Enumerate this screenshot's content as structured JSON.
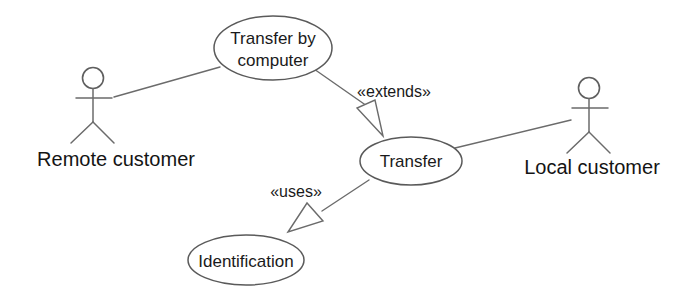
{
  "diagram": {
    "kind": "uml-use-case-diagram",
    "background_color": "#ffffff",
    "line_color": "#6b6b6b",
    "text_color": "#1a1a1a",
    "actors": [
      {
        "id": "remote-customer",
        "label": "Remote customer",
        "label_x": 116,
        "label_y": 166,
        "head_cx": 93,
        "head_cy": 78,
        "head_r": 10.5,
        "body_top_y": 88.5,
        "body_bottom_y": 122,
        "arm_y": 98,
        "arm_left_x": 76,
        "arm_right_x": 112,
        "leg_left_x": 71,
        "leg_right_x": 114,
        "leg_bottom_y": 143
      },
      {
        "id": "local-customer",
        "label": "Local customer",
        "label_x": 592,
        "label_y": 174,
        "head_cx": 589,
        "head_cy": 88,
        "head_r": 10.5,
        "body_top_y": 98.5,
        "body_bottom_y": 132,
        "arm_y": 108,
        "arm_left_x": 572,
        "arm_right_x": 608,
        "leg_left_x": 567,
        "leg_right_x": 610,
        "leg_bottom_y": 153
      }
    ],
    "use_cases": [
      {
        "id": "transfer-by-computer",
        "lines": [
          "Transfer by",
          "computer"
        ],
        "line1": "Transfer by",
        "line2": "computer",
        "cx": 273,
        "cy": 48,
        "rx": 59,
        "ry": 32,
        "text_x": 273,
        "text_y1": 44,
        "text_y2": 66
      },
      {
        "id": "transfer",
        "line1": "Transfer",
        "cx": 411,
        "cy": 161,
        "rx": 51,
        "ry": 24,
        "text_x": 411,
        "text_y1": 167
      },
      {
        "id": "identification",
        "line1": "Identification",
        "cx": 246,
        "cy": 260,
        "rx": 58,
        "ry": 25,
        "text_x": 246,
        "text_y1": 267
      }
    ],
    "associations": [
      {
        "id": "remote-customer-to-transfer-by-computer",
        "from": "remote-customer",
        "to": "transfer-by-computer",
        "x1": 114,
        "y1": 97,
        "x2": 220,
        "y2": 67
      },
      {
        "id": "local-customer-to-transfer",
        "from": "local-customer",
        "to": "transfer",
        "x1": 571,
        "y1": 120,
        "x2": 455,
        "y2": 148
      }
    ],
    "relationships": [
      {
        "id": "extends-relationship",
        "label": "«extends»",
        "from": "transfer-by-computer",
        "to": "transfer",
        "line_x1": 314,
        "line_y1": 69,
        "line_x2": 367,
        "line_y2": 106,
        "arrow_tip_x": 383,
        "arrow_tip_y": 136,
        "arrow_b1_x": 357,
        "arrow_b1_y": 108,
        "arrow_b2_x": 375,
        "arrow_b2_y": 100,
        "label_x": 394,
        "label_y": 97
      },
      {
        "id": "uses-relationship",
        "label": "«uses»",
        "from": "transfer",
        "to": "identification",
        "line_x1": 369,
        "line_y1": 180,
        "line_x2": 322,
        "line_y2": 211,
        "arrow_tip_x": 288,
        "arrow_tip_y": 232,
        "arrow_b1_x": 307,
        "arrow_b1_y": 203,
        "arrow_b2_x": 323,
        "arrow_b2_y": 221,
        "label_x": 296,
        "label_y": 197
      }
    ]
  }
}
